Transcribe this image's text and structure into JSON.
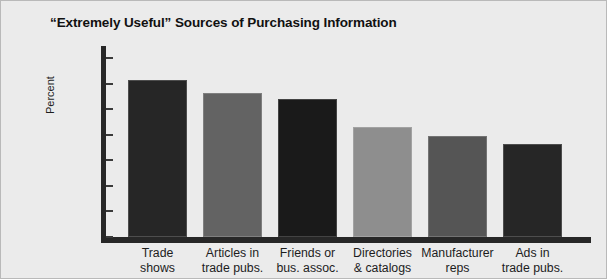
{
  "chart_data": {
    "type": "bar",
    "title": "“Extremely Useful” Sources of Purchasing Information",
    "xlabel": "",
    "ylabel": "Percent",
    "ylim": [
      30,
      100
    ],
    "ytick_labels": [
      "100",
      "90",
      "80",
      "70",
      "60",
      "50",
      "40",
      "30"
    ],
    "yticks": [
      100,
      90,
      80,
      70,
      60,
      50,
      40,
      30
    ],
    "grid": false,
    "legend": "none",
    "categories": [
      "Trade\nshows",
      "Articles in\ntrade pubs.",
      "Friends or\nbus. assoc.",
      "Directories\n& catalogs",
      "Manufacturer\nreps",
      "Ads in\ntrade pubs."
    ],
    "values": [
      91.5,
      86.5,
      84,
      73,
      69.5,
      66.5
    ],
    "bar_colors": [
      "#262626",
      "#636363",
      "#1a1a1a",
      "#8e8e8e",
      "#555555",
      "#262626"
    ]
  },
  "figure": {
    "background_color": "#ebebeb",
    "axis_color": "#272727",
    "text_color": "#1d1d1d"
  }
}
